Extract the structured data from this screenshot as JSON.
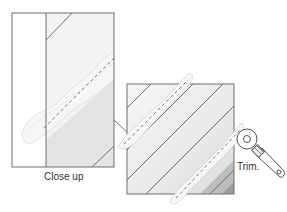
{
  "labels": {
    "close_up": "Close up",
    "trim": "Trim."
  },
  "colors": {
    "outline": "#6f6f6f",
    "light_fabric": "#f4f4f4",
    "mid_fabric": "#e6e6e6",
    "dark_fabric": "#cfcfcf",
    "darkest_fabric": "#9e9e9e",
    "seam_foam": "#f2f2f2",
    "seam_dash": "#6a6a6a"
  },
  "diagram": {
    "close_up_panel": {
      "x": 12,
      "y": 13,
      "width": 102,
      "height": 154
    },
    "square_panel": {
      "x": 127,
      "y": 84,
      "width": 107,
      "height": 110
    }
  }
}
